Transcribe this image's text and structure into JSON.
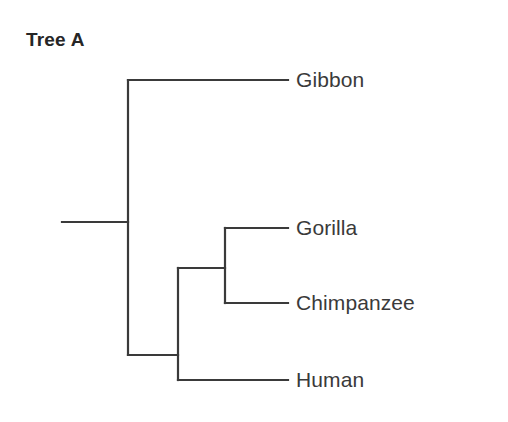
{
  "figure": {
    "title": "Tree A",
    "line_color": "#3a3a3a",
    "background_color": "#ffffff",
    "text_color": "#3a3a3a",
    "title_color": "#262626"
  },
  "chart_data": {
    "type": "diagram",
    "diagram_type": "cladogram",
    "title": "Tree A",
    "orientation": "left-to-right",
    "newick": "(Gibbon,((Gorilla,Chimpanzee),Human));",
    "taxa": [
      {
        "name": "Gibbon",
        "tip_x": 288,
        "tip_y": 80,
        "label_x": 296,
        "label_y": 80
      },
      {
        "name": "Gorilla",
        "tip_x": 288,
        "tip_y": 228,
        "label_x": 296,
        "label_y": 228
      },
      {
        "name": "Chimpanzee",
        "tip_x": 288,
        "tip_y": 303,
        "label_x": 296,
        "label_y": 303
      },
      {
        "name": "Human",
        "tip_x": 288,
        "tip_y": 380,
        "label_x": 296,
        "label_y": 380
      }
    ],
    "nodes": [
      {
        "id": "root",
        "x": 128,
        "y": 222,
        "children": [
          "Gibbon",
          "great-apes"
        ]
      },
      {
        "id": "great-apes",
        "x": 178,
        "y": 355,
        "children": [
          "gorilla-chimp",
          "Human"
        ]
      },
      {
        "id": "gorilla-chimp",
        "x": 225,
        "y": 268,
        "children": [
          "Gorilla",
          "Chimpanzee"
        ]
      }
    ],
    "root_stem": {
      "x1": 62,
      "x2": 128,
      "y": 222
    },
    "segments": [
      {
        "name": "root-stem",
        "x1": 62,
        "y1": 222,
        "x2": 128,
        "y2": 222
      },
      {
        "name": "root-vertical",
        "x1": 128,
        "y1": 80,
        "x2": 128,
        "y2": 355
      },
      {
        "name": "gibbon-branch",
        "x1": 128,
        "y1": 80,
        "x2": 288,
        "y2": 80
      },
      {
        "name": "great-apes-connector",
        "x1": 128,
        "y1": 355,
        "x2": 178,
        "y2": 355
      },
      {
        "name": "great-apes-vertical",
        "x1": 178,
        "y1": 268,
        "x2": 178,
        "y2": 380
      },
      {
        "name": "human-branch",
        "x1": 178,
        "y1": 380,
        "x2": 288,
        "y2": 380
      },
      {
        "name": "gorilla-chimp-connector",
        "x1": 178,
        "y1": 268,
        "x2": 225,
        "y2": 268
      },
      {
        "name": "gorilla-chimp-vertical",
        "x1": 225,
        "y1": 228,
        "x2": 225,
        "y2": 303
      },
      {
        "name": "gorilla-branch",
        "x1": 225,
        "y1": 228,
        "x2": 288,
        "y2": 228
      },
      {
        "name": "chimpanzee-branch",
        "x1": 225,
        "y1": 303,
        "x2": 288,
        "y2": 303
      }
    ]
  }
}
